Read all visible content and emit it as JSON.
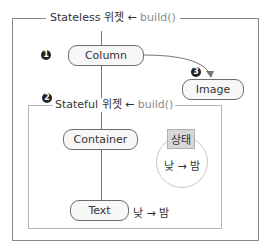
{
  "outer": {
    "title_main": "Stateless 위젯 ",
    "title_arrow": "←",
    "title_call": " build()"
  },
  "inner": {
    "marker": "2",
    "title_main": "Stateful 위젯 ",
    "title_arrow": "←",
    "title_call": " build()"
  },
  "nodes": {
    "column": {
      "label": "Column",
      "marker": "1"
    },
    "image": {
      "label": "Image",
      "marker": "3"
    },
    "container": {
      "label": "Container"
    },
    "text": {
      "label": "Text",
      "value": "낮 → 밤"
    }
  },
  "state": {
    "badge": "상태",
    "transition": "낮 → 밤"
  }
}
